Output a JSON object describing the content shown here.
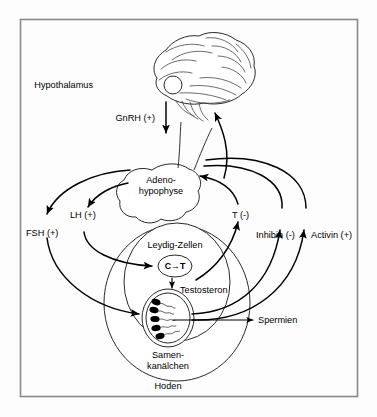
{
  "figure": {
    "language": "de",
    "frame": {
      "color": "#8a8a8a"
    },
    "background_color": "#fdfdfd",
    "text_color": "#000000"
  },
  "labels": {
    "hypothalamus": "Hypothalamus",
    "gnrh": "GnRH (+)",
    "adenohypophyse_line1": "Adeno-",
    "adenohypophyse_line2": "hypophyse",
    "fsh": "FSH (+)",
    "lh": "LH (+)",
    "t_negative": "T (-)",
    "inhibin": "Inhibin (-)",
    "activin": "Activin (+)",
    "leydig_zellen": "Leydig-Zellen",
    "conversion": "C→T",
    "testosteron": "Testosteron",
    "spermien": "Spermien",
    "samenkanaelchen_line1": "Samen-",
    "samenkanaelchen_line2": "kanälchen",
    "hoden": "Hoden"
  },
  "diagram_data": {
    "type": "flow-diagram",
    "nodes": [
      {
        "id": "hypothalamus",
        "label": "Hypothalamus",
        "shape": "brain"
      },
      {
        "id": "adenohypophyse",
        "label": "Adeno-hypophyse",
        "shape": "gland"
      },
      {
        "id": "hoden",
        "label": "Hoden",
        "shape": "ellipse"
      },
      {
        "id": "leydig",
        "label": "Leydig-Zellen",
        "shape": "ellipse"
      },
      {
        "id": "conversion",
        "label": "C→T",
        "shape": "circle"
      },
      {
        "id": "samenkanaelchen",
        "label": "Samen-kanälchen",
        "shape": "ellipse"
      },
      {
        "id": "spermien",
        "label": "Spermien",
        "shape": "output"
      }
    ],
    "edges": [
      {
        "from": "hypothalamus",
        "to": "adenohypophyse",
        "label": "GnRH (+)",
        "sign": "+"
      },
      {
        "from": "adenohypophyse",
        "to": "samenkanaelchen",
        "label": "FSH (+)",
        "sign": "+"
      },
      {
        "from": "adenohypophyse",
        "to": "leydig",
        "label": "LH (+)",
        "sign": "+"
      },
      {
        "from": "leydig",
        "to": "adenohypophyse",
        "label": "T (-)",
        "sign": "-"
      },
      {
        "from": "leydig",
        "to": "hypothalamus",
        "label": "T (-)",
        "sign": "-"
      },
      {
        "from": "samenkanaelchen",
        "to": "adenohypophyse",
        "label": "Inhibin (-)",
        "sign": "-"
      },
      {
        "from": "samenkanaelchen",
        "to": "adenohypophyse",
        "label": "Activin (+)",
        "sign": "+"
      },
      {
        "from": "conversion",
        "to": "testosteron",
        "label": "Testosteron",
        "sign": ""
      },
      {
        "from": "samenkanaelchen",
        "to": "spermien",
        "label": "Spermien",
        "sign": ""
      }
    ]
  }
}
